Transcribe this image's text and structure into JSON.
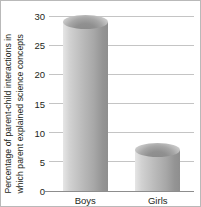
{
  "chart_data": {
    "type": "bar",
    "title": "",
    "xlabel": "",
    "ylabel_line1": "Percentage of parent-child interactions in",
    "ylabel_line2": "which parent explained science concepts",
    "categories": [
      "Boys",
      "Girls"
    ],
    "values": [
      29,
      7
    ],
    "ylim": [
      0,
      30
    ],
    "yticks": [
      0,
      5,
      10,
      15,
      20,
      25,
      30
    ],
    "ytick_labels": [
      "0",
      "5",
      "10",
      "15",
      "20",
      "25",
      "30"
    ],
    "grid": true,
    "legend": null,
    "bar_style": "cylinder-3d",
    "colors": {
      "bar_light": "#e6e6e6",
      "bar_dark": "#8e8e8e",
      "gridline": "#c4c4c4",
      "axis": "#8d8d8d",
      "text": "#231f20",
      "frame": "#b9b9b9",
      "background": "#ffffff"
    }
  }
}
